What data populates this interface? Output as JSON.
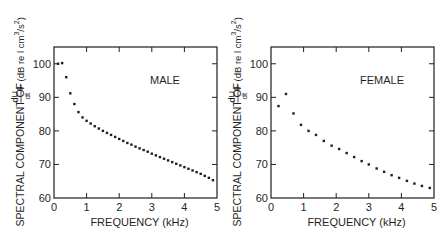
{
  "chart_data": [
    {
      "type": "scatter",
      "panel_label": "MALE",
      "xlabel": "FREQUENCY (kHz)",
      "ylabel": "SPECTRAL COMPONENT OF dU_g/dt (dB re l cm^3/s^2)",
      "ylabel_parts": {
        "prefix": "SPECTRAL COMPONENT OF",
        "frac_num": "dU",
        "frac_sub": "g",
        "frac_den": "dt",
        "unit": "(dB re l cm",
        "unit_sup1": "3",
        "unit_mid": "/s",
        "unit_sup2": "2",
        "unit_end": ")"
      },
      "xlim": [
        0,
        5
      ],
      "ylim": [
        60,
        105
      ],
      "xticks": [
        0,
        1,
        2,
        3,
        4,
        5
      ],
      "yticks": [
        60,
        70,
        80,
        90,
        100
      ],
      "grid": false,
      "x": [
        0.125,
        0.25,
        0.375,
        0.5,
        0.625,
        0.75,
        0.875,
        1.0,
        1.125,
        1.25,
        1.375,
        1.5,
        1.625,
        1.75,
        1.875,
        2.0,
        2.125,
        2.25,
        2.375,
        2.5,
        2.625,
        2.75,
        2.875,
        3.0,
        3.125,
        3.25,
        3.375,
        3.5,
        3.625,
        3.75,
        3.875,
        4.0,
        4.125,
        4.25,
        4.375,
        4.5,
        4.625,
        4.75,
        4.875
      ],
      "y": [
        100,
        100.2,
        96,
        91.2,
        88,
        85.6,
        84,
        83,
        82.2,
        81.4,
        80.7,
        80,
        79.4,
        78.8,
        78.2,
        77.6,
        77,
        76.4,
        75.9,
        75.3,
        74.8,
        74.3,
        73.8,
        73.2,
        72.7,
        72.2,
        71.7,
        71.2,
        70.7,
        70.2,
        69.7,
        69.2,
        68.7,
        68.2,
        67.7,
        67.2,
        66.6,
        66,
        65.3
      ]
    },
    {
      "type": "scatter",
      "panel_label": "FEMALE",
      "xlabel": "FREQUENCY (kHz)",
      "ylabel": "SPECTRAL COMPONENT OF dU_g/dt (dB re l cm^3/s^2)",
      "ylabel_parts": {
        "prefix": "SPECTRAL COMPONENT OF",
        "frac_num": "dU",
        "frac_sub": "g",
        "frac_den": "dt",
        "unit": "(dB re l cm",
        "unit_sup1": "3",
        "unit_mid": "/s",
        "unit_sup2": "2",
        "unit_end": ")"
      },
      "xlim": [
        0,
        5
      ],
      "ylim": [
        60,
        105
      ],
      "xticks": [
        0,
        1,
        2,
        3,
        4,
        5
      ],
      "yticks": [
        60,
        70,
        80,
        90,
        100
      ],
      "grid": false,
      "x": [
        0.23,
        0.46,
        0.69,
        0.92,
        1.15,
        1.38,
        1.62,
        1.86,
        2.09,
        2.32,
        2.55,
        2.78,
        3.0,
        3.24,
        3.47,
        3.7,
        3.93,
        4.17,
        4.4,
        4.63,
        4.87
      ],
      "y": [
        87.4,
        91,
        85.2,
        81.8,
        80,
        78.8,
        77,
        75.6,
        74.6,
        73.4,
        72.2,
        71,
        70,
        68.8,
        67.8,
        66.8,
        66,
        65.1,
        64.3,
        63.6,
        63
      ]
    }
  ]
}
